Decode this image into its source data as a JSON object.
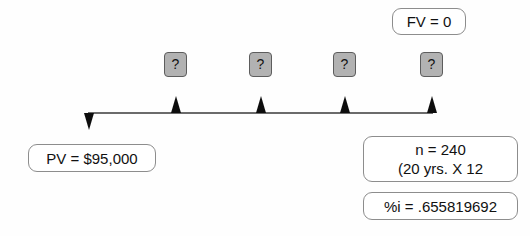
{
  "diagram": {
    "type": "cash-flow-timeline",
    "title_text": "",
    "future_value": {
      "label": "FV = 0"
    },
    "present_value": {
      "label": "PV = $95,000"
    },
    "periods": {
      "line_1": "n = 240",
      "line_2": "(20 yrs. X 12"
    },
    "interest_rate": {
      "label": "%i = .655819692"
    },
    "payment_boxes": [
      {
        "label": "?"
      },
      {
        "label": "?"
      },
      {
        "label": "?"
      },
      {
        "label": "?"
      }
    ],
    "timeline": {
      "start_marker": "down-arrow",
      "period_markers": [
        "up-arrow",
        "up-arrow",
        "up-arrow",
        "up-arrow"
      ]
    },
    "colors": {
      "box_border": "#8d8d8d",
      "payment_box_fill": "#b2b2b2",
      "payment_box_border": "#5d5d5d",
      "timeline": "#6b6b6b",
      "arrow": "#0d0d0d",
      "text": "#111111",
      "background": "#fefefe"
    }
  }
}
